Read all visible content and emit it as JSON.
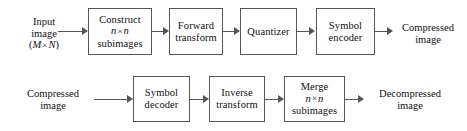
{
  "diagram": {
    "stroke_color": "#55565a",
    "background": "#ffffff",
    "rows": [
      {
        "name": "encoder",
        "nodes": [
          {
            "id": "input-image",
            "kind": "label",
            "lines": [
              "Input",
              "image",
              "(M × N)"
            ],
            "line_styles": [
              "plain",
              "plain",
              "math"
            ]
          },
          {
            "id": "construct-subimages",
            "kind": "box",
            "lines": [
              "Construct",
              "n × n",
              "subimages"
            ],
            "line_styles": [
              "plain",
              "math",
              "plain"
            ]
          },
          {
            "id": "forward-transform",
            "kind": "box",
            "lines": [
              "Forward",
              "transform"
            ],
            "line_styles": [
              "plain",
              "plain"
            ]
          },
          {
            "id": "quantizer",
            "kind": "box",
            "lines": [
              "Quantizer"
            ],
            "line_styles": [
              "plain"
            ]
          },
          {
            "id": "symbol-encoder",
            "kind": "box",
            "lines": [
              "Symbol",
              "encoder"
            ],
            "line_styles": [
              "plain",
              "plain"
            ]
          },
          {
            "id": "compressed-image-out",
            "kind": "label",
            "lines": [
              "Compressed",
              "image"
            ],
            "line_styles": [
              "plain",
              "plain"
            ]
          }
        ]
      },
      {
        "name": "decoder",
        "nodes": [
          {
            "id": "compressed-image-in",
            "kind": "label",
            "lines": [
              "Compressed",
              "image"
            ],
            "line_styles": [
              "plain",
              "plain"
            ]
          },
          {
            "id": "symbol-decoder",
            "kind": "box",
            "lines": [
              "Symbol",
              "decoder"
            ],
            "line_styles": [
              "plain",
              "plain"
            ]
          },
          {
            "id": "inverse-transform",
            "kind": "box",
            "lines": [
              "Inverse",
              "transform"
            ],
            "line_styles": [
              "plain",
              "plain"
            ]
          },
          {
            "id": "merge-subimages",
            "kind": "box",
            "lines": [
              "Merge",
              "n × n",
              "subimages"
            ],
            "line_styles": [
              "plain",
              "math",
              "plain"
            ]
          },
          {
            "id": "decompressed-image-out",
            "kind": "label",
            "lines": [
              "Decompressed",
              "image"
            ],
            "line_styles": [
              "plain",
              "plain"
            ]
          }
        ]
      }
    ],
    "math_tokens": {
      "m": "M",
      "n": "n",
      "n_capital": "N",
      "times": "×",
      "paren_open": "(",
      "paren_close": ")"
    }
  }
}
